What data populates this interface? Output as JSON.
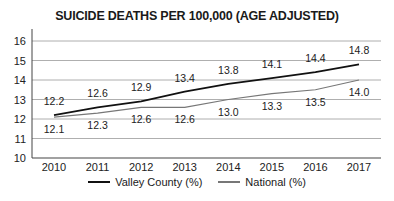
{
  "chart_data": {
    "type": "line",
    "title": "SUICIDE DEATHS PER 100,000 (AGE ADJUSTED)",
    "xlabel": "",
    "ylabel": "",
    "categories": [
      "2010",
      "2011",
      "2012",
      "2013",
      "2014",
      "2015",
      "2016",
      "2017"
    ],
    "ylim": [
      10,
      16
    ],
    "yticks": [
      "10",
      "11",
      "12",
      "13",
      "14",
      "15",
      "16"
    ],
    "grid": true,
    "legend_position": "bottom",
    "series": [
      {
        "name": "Valley County (%)",
        "color": "#111111",
        "values": [
          12.2,
          12.6,
          12.9,
          13.4,
          13.8,
          14.1,
          14.4,
          14.8
        ]
      },
      {
        "name": "National (%)",
        "color": "#777777",
        "values": [
          12.1,
          12.3,
          12.6,
          12.6,
          13.0,
          13.3,
          13.5,
          14.0
        ]
      }
    ]
  }
}
